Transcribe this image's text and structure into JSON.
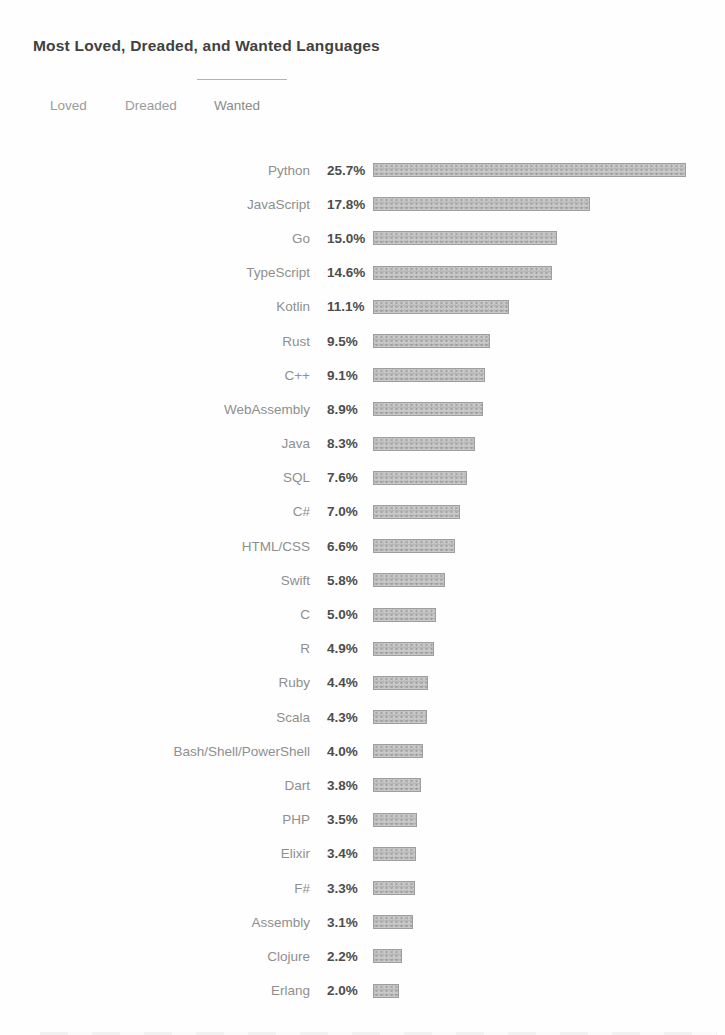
{
  "title": "Most Loved, Dreaded, and Wanted Languages",
  "tabs": [
    {
      "label": "Loved",
      "active": false
    },
    {
      "label": "Dreaded",
      "active": false
    },
    {
      "label": "Wanted",
      "active": true
    }
  ],
  "chart_data": {
    "type": "bar",
    "orientation": "horizontal",
    "title": "Most Loved, Dreaded, and Wanted Languages",
    "active_tab": "Wanted",
    "categories": [
      "Python",
      "JavaScript",
      "Go",
      "TypeScript",
      "Kotlin",
      "Rust",
      "C++",
      "WebAssembly",
      "Java",
      "SQL",
      "C#",
      "HTML/CSS",
      "Swift",
      "C",
      "R",
      "Ruby",
      "Scala",
      "Bash/Shell/PowerShell",
      "Dart",
      "PHP",
      "Elixir",
      "F#",
      "Assembly",
      "Clojure",
      "Erlang"
    ],
    "values": [
      25.7,
      17.8,
      15.0,
      14.6,
      11.1,
      9.5,
      9.1,
      8.9,
      8.3,
      7.6,
      7.0,
      6.6,
      5.8,
      5.0,
      4.9,
      4.4,
      4.3,
      4.0,
      3.8,
      3.5,
      3.4,
      3.3,
      3.1,
      2.2,
      2.0
    ],
    "values_formatted": [
      "25.7%",
      "17.8%",
      "15.0%",
      "14.6%",
      "11.1%",
      "9.5%",
      "9.1%",
      "8.9%",
      "8.3%",
      "7.6%",
      "7.0%",
      "6.6%",
      "5.8%",
      "5.0%",
      "4.9%",
      "4.4%",
      "4.3%",
      "4.0%",
      "3.8%",
      "3.5%",
      "3.4%",
      "3.3%",
      "3.1%",
      "2.2%",
      "2.0%"
    ],
    "value_suffix": "%",
    "xlim": [
      0,
      26
    ],
    "grid": false,
    "legend": false,
    "bar_color": "#c9c9c9",
    "bar_border_color": "#9e9e9e",
    "label_color": "#8f8f8f",
    "value_color": "#4d4d4d"
  }
}
